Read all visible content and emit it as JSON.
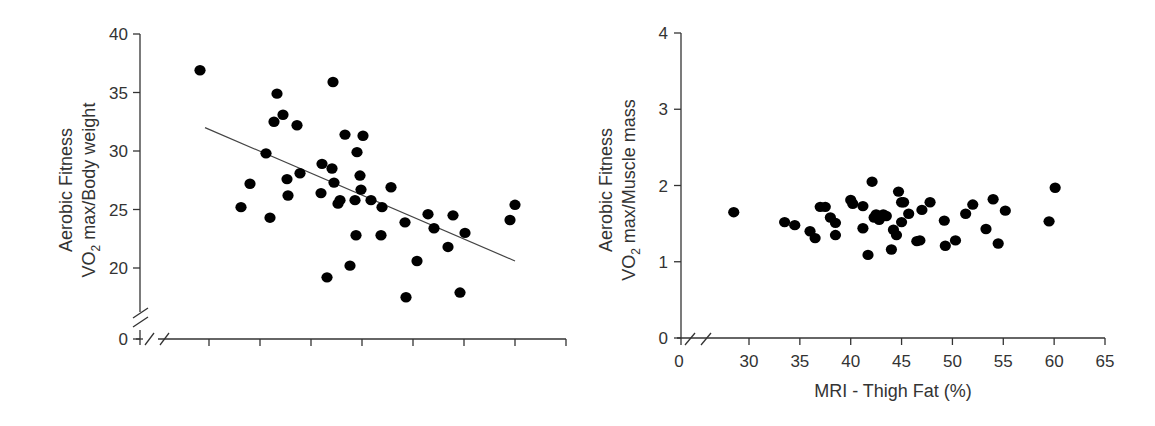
{
  "chart_data": [
    {
      "type": "scatter",
      "title": "",
      "xlabel": "",
      "ylabel": [
        "Aerobic Fitness",
        "VO2 max/Body weight"
      ],
      "ylim": [
        0,
        40
      ],
      "y_ticks": [
        "0",
        "20",
        "25",
        "30",
        "35",
        "40"
      ],
      "x_ticks": [],
      "x_tick_count": 8,
      "axis_break_y": true,
      "axis_break_x": true,
      "grid": false,
      "legend": null,
      "trendline": {
        "x_px": [
          205,
          515
        ],
        "y": [
          32.0,
          20.6
        ]
      },
      "points_px_x_y": [
        [
          200,
          36.9
        ],
        [
          241,
          25.2
        ],
        [
          250,
          27.2
        ],
        [
          266,
          29.8
        ],
        [
          270,
          24.3
        ],
        [
          274,
          32.5
        ],
        [
          277,
          34.9
        ],
        [
          283,
          33.1
        ],
        [
          287,
          27.6
        ],
        [
          288,
          26.2
        ],
        [
          297,
          32.2
        ],
        [
          300,
          28.1
        ],
        [
          321,
          26.4
        ],
        [
          322,
          28.9
        ],
        [
          327,
          19.2
        ],
        [
          332,
          28.5
        ],
        [
          333,
          35.9
        ],
        [
          334,
          27.3
        ],
        [
          338,
          25.5
        ],
        [
          340,
          25.8
        ],
        [
          345,
          31.4
        ],
        [
          350,
          20.2
        ],
        [
          355,
          25.8
        ],
        [
          357,
          29.9
        ],
        [
          360,
          27.9
        ],
        [
          361,
          26.7
        ],
        [
          363,
          31.3
        ],
        [
          356,
          22.8
        ],
        [
          371,
          25.8
        ],
        [
          381,
          22.8
        ],
        [
          382,
          25.2
        ],
        [
          391,
          26.9
        ],
        [
          405,
          23.9
        ],
        [
          406,
          17.5
        ],
        [
          417,
          20.6
        ],
        [
          428,
          24.6
        ],
        [
          434,
          23.4
        ],
        [
          448,
          21.8
        ],
        [
          453,
          24.5
        ],
        [
          460,
          17.9
        ],
        [
          465,
          23.0
        ],
        [
          510,
          24.1
        ],
        [
          515,
          25.4
        ]
      ]
    },
    {
      "type": "scatter",
      "title": "",
      "xlabel": "MRI - Thigh Fat (%)",
      "ylabel": [
        "Aerobic Fitness",
        "VO2 max/Muscle mass"
      ],
      "xlim": [
        0,
        65
      ],
      "ylim": [
        0,
        4
      ],
      "x_ticks": [
        "0",
        "30",
        "35",
        "40",
        "45",
        "50",
        "55",
        "60",
        "65"
      ],
      "y_ticks": [
        "0",
        "1",
        "2",
        "3",
        "4"
      ],
      "axis_break_x": true,
      "grid": false,
      "legend": null,
      "points": [
        [
          28.5,
          1.65
        ],
        [
          33.5,
          1.52
        ],
        [
          34.5,
          1.48
        ],
        [
          36,
          1.4
        ],
        [
          36.5,
          1.31
        ],
        [
          37,
          1.72
        ],
        [
          37.5,
          1.72
        ],
        [
          38,
          1.58
        ],
        [
          38.5,
          1.51
        ],
        [
          38.5,
          1.35
        ],
        [
          40,
          1.81
        ],
        [
          40.2,
          1.76
        ],
        [
          41.2,
          1.73
        ],
        [
          41.2,
          1.44
        ],
        [
          41.7,
          1.09
        ],
        [
          42.1,
          2.05
        ],
        [
          42.3,
          1.58
        ],
        [
          42.5,
          1.62
        ],
        [
          42.8,
          1.55
        ],
        [
          43.2,
          1.62
        ],
        [
          43.5,
          1.6
        ],
        [
          44,
          1.16
        ],
        [
          44.2,
          1.42
        ],
        [
          44.5,
          1.35
        ],
        [
          44.7,
          1.92
        ],
        [
          45,
          1.78
        ],
        [
          45,
          1.52
        ],
        [
          45.2,
          1.78
        ],
        [
          45.7,
          1.63
        ],
        [
          46.5,
          1.27
        ],
        [
          46.8,
          1.28
        ],
        [
          47,
          1.68
        ],
        [
          47.8,
          1.78
        ],
        [
          49.2,
          1.54
        ],
        [
          49.3,
          1.21
        ],
        [
          50.3,
          1.28
        ],
        [
          51.3,
          1.63
        ],
        [
          52,
          1.75
        ],
        [
          53.3,
          1.43
        ],
        [
          54,
          1.82
        ],
        [
          54.5,
          1.24
        ],
        [
          55.2,
          1.67
        ],
        [
          59.5,
          1.53
        ],
        [
          60.1,
          1.97
        ]
      ]
    }
  ],
  "labels": {
    "left_ylabel_line1": "Aerobic Fitness",
    "left_ylabel_line2_main": "VO",
    "left_ylabel_line2_sub": "2",
    "left_ylabel_line2_rest": " max/Body weight",
    "right_ylabel_line1": "Aerobic Fitness",
    "right_ylabel_line2_main": "VO",
    "right_ylabel_line2_sub": "2",
    "right_ylabel_line2_rest": " max/Muscle mass",
    "right_xlabel": "MRI - Thigh Fat (%)"
  },
  "colors": {
    "axis": "#333333",
    "point": "#000000",
    "trend": "#444444"
  }
}
